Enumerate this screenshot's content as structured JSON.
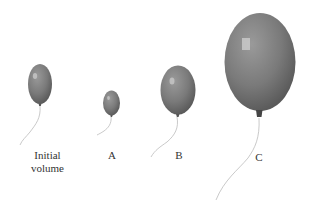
{
  "diagram": {
    "balloon_color": "#7a7a7a",
    "balloons": [
      {
        "id": "initial",
        "label_line1": "Initial",
        "label_line2": "volume"
      },
      {
        "id": "a",
        "label": "A"
      },
      {
        "id": "b",
        "label": "B"
      },
      {
        "id": "c",
        "label": "C"
      }
    ]
  }
}
